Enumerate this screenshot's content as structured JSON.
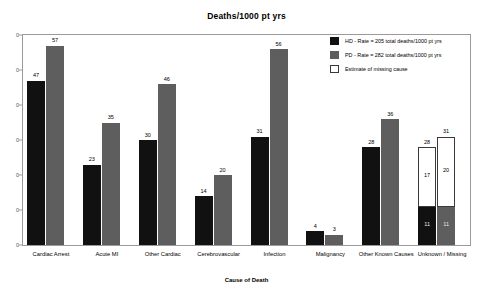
{
  "chart_data": {
    "type": "bar",
    "title": "Deaths/1000 pt yrs",
    "xlabel": "Cause of Death",
    "ylabel": "",
    "ylim": [
      0,
      60
    ],
    "yticks": [
      "60",
      "50",
      "40",
      "30",
      "20",
      "10",
      "0"
    ],
    "ytick_display": [
      "0",
      "0",
      "0",
      "0",
      "0",
      "0",
      "0"
    ],
    "grid": false,
    "legend_position": "top-right",
    "categories": [
      "Cardiac Arrest",
      "Acute MI",
      "Other Cardiac",
      "Cerebrovascular",
      "Infection",
      "Malignancy",
      "Other Known Causes",
      "Unknown / Missing"
    ],
    "series": [
      {
        "name": "HD",
        "legend": "HD - Rate = 205 total deaths/1000 pt  yrs",
        "color": "#111111",
        "values": [
          47,
          23,
          30,
          14,
          31,
          4,
          28,
          28
        ]
      },
      {
        "name": "PD",
        "legend": "PD - Rate = 282 total deaths/1000 pt  yrs",
        "color": "#5e5e5e",
        "values": [
          57,
          35,
          46,
          20,
          56,
          3,
          36,
          31
        ]
      },
      {
        "name": "Estimate of missing cause",
        "legend": "Estimate of missing cause",
        "color": "#ffffff",
        "values": [
          null,
          null,
          null,
          null,
          null,
          null,
          null,
          null
        ]
      }
    ],
    "stacked_last_group": {
      "category": "Unknown / Missing",
      "hd_known": 11,
      "hd_missing": 17,
      "hd_total": 28,
      "pd_known": 11,
      "pd_missing": 20,
      "pd_total": 31
    }
  },
  "legend": {
    "items": [
      {
        "label": "HD - Rate = 205 total deaths/1000 pt  yrs",
        "swatch": "black"
      },
      {
        "label": "PD - Rate = 282 total deaths/1000 pt  yrs",
        "swatch": "gray"
      },
      {
        "label": "Estimate of missing cause",
        "swatch": "white"
      }
    ]
  }
}
